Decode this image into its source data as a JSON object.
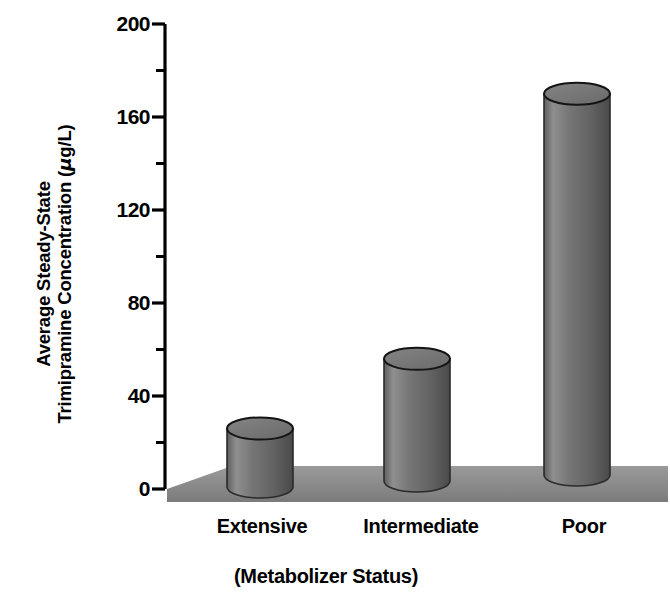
{
  "figure": {
    "background_color": "#ffffff",
    "ink_color": "#000000"
  },
  "axes": {
    "y_title_line1": "Average Steady-State",
    "y_title_line2_prefix": "Trimipramine Concentration (",
    "y_title_mu": "μ",
    "y_title_line2_suffix": "g/L)",
    "x_title": "(Metabolizer Status)"
  },
  "chart_data": {
    "type": "bar",
    "title": "",
    "subtitle": "",
    "xlabel": "(Metabolizer Status)",
    "ylabel": "Average Steady-State Trimipramine Concentration (μg/L)",
    "categories": [
      "Extensive",
      "Intermediate",
      "Poor"
    ],
    "values": [
      26,
      56,
      170
    ],
    "units": "μg/L",
    "ylim": [
      0,
      200
    ],
    "y_major_ticks": [
      0,
      40,
      80,
      120,
      160,
      200
    ],
    "y_minor_ticks": [
      20,
      60,
      100,
      140,
      180
    ],
    "y_tick_labels": [
      "0",
      "40",
      "80",
      "120",
      "160",
      "200"
    ],
    "grid": false,
    "legend": null,
    "legend_position": "none",
    "style": "3d-cylinder",
    "series": [
      {
        "name": "Average steady-state trimipramine concentration",
        "values": [
          26,
          56,
          170
        ]
      }
    ],
    "colors": {
      "bar_body": "#6b6b6b",
      "bar_body_light": "#8d8d8d",
      "bar_body_dark": "#4c4c4c",
      "bar_top": "#7a7a7a",
      "bar_outline": "#1a1a1a",
      "floor": "#8a8a8a",
      "floor_front": "#7c7c7c",
      "axis": "#000000"
    }
  }
}
